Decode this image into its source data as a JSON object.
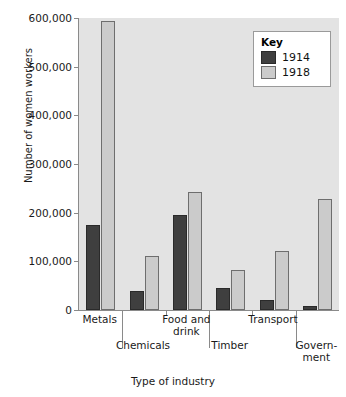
{
  "chart_data": {
    "type": "bar",
    "title": "",
    "xlabel": "Type of industry",
    "ylabel": "Number of women workers",
    "ylim": [
      0,
      600000
    ],
    "yticks": [
      0,
      100000,
      200000,
      300000,
      400000,
      500000,
      600000
    ],
    "ytick_labels": [
      "0",
      "100,000",
      "200,000",
      "300,000",
      "400,000",
      "500,000",
      "600,000"
    ],
    "grid": false,
    "legend": {
      "title": "Key",
      "position": "top-right",
      "entries": [
        {
          "name": "1914",
          "color": "#3f3f3f"
        },
        {
          "name": "1918",
          "color": "#cbcbcb"
        }
      ]
    },
    "categories": [
      "Metals",
      "Chemicals",
      "Food and drink",
      "Timber",
      "Transport",
      "Government"
    ],
    "category_display": [
      {
        "lines": [
          "Metals"
        ],
        "row": "top"
      },
      {
        "lines": [
          "Chemicals"
        ],
        "row": "bottom"
      },
      {
        "lines": [
          "Food and",
          "drink"
        ],
        "row": "top"
      },
      {
        "lines": [
          "Timber"
        ],
        "row": "bottom"
      },
      {
        "lines": [
          "Transport"
        ],
        "row": "top"
      },
      {
        "lines": [
          "Govern-",
          "ment"
        ],
        "row": "bottom"
      }
    ],
    "series": [
      {
        "name": "1914",
        "color": "#3f3f3f",
        "values": [
          174000,
          40000,
          196000,
          45000,
          20000,
          8000
        ]
      },
      {
        "name": "1918",
        "color": "#cbcbcb",
        "values": [
          593000,
          110000,
          242000,
          82000,
          122000,
          228000
        ]
      }
    ]
  },
  "colors": {
    "plot_background": "#e3e3e3",
    "page_background": "#ffffff",
    "axis": "#8a8a8a",
    "series_1914": "#3f3f3f",
    "series_1918": "#cbcbcb",
    "text": "#1a1a1a"
  }
}
